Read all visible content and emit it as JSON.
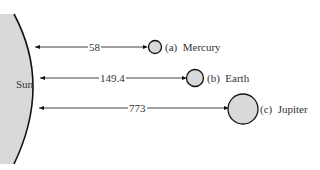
{
  "diagram": {
    "sun_label": "Sun",
    "planets": [
      {
        "letter": "(a)",
        "name": "Mercury",
        "distance": "58"
      },
      {
        "letter": "(b)",
        "name": "Earth",
        "distance": "149.4"
      },
      {
        "letter": "(c)",
        "name": "Jupiter",
        "distance": "773"
      }
    ],
    "colors": {
      "fill": "#d9d9d9",
      "stroke": "#111111"
    }
  }
}
